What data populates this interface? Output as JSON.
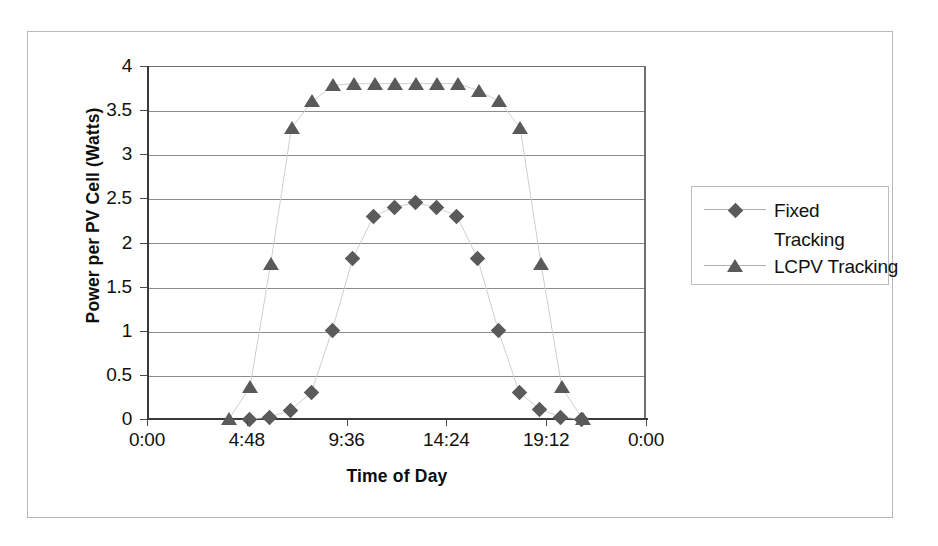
{
  "figure": {
    "frame_present": true,
    "background_color": "#ffffff",
    "marker_color": "#5a5a5a",
    "axis_color": "#3a3a3a",
    "gridline_color": "#8a8a8a"
  },
  "chart_data": {
    "type": "scatter",
    "title": "",
    "subtitle": "",
    "xlabel": "Time of Day",
    "ylabel": "Power per PV Cell (Watts)",
    "xlim": [
      0,
      24
    ],
    "ylim": [
      0,
      4
    ],
    "yticks": [
      0,
      0.5,
      1,
      1.5,
      2,
      2.5,
      3,
      3.5,
      4
    ],
    "ytick_labels": [
      "0",
      "0.5",
      "1",
      "1.5",
      "2",
      "2.5",
      "3",
      "3.5",
      "4"
    ],
    "xticks": [
      0,
      4.8,
      9.6,
      14.4,
      19.2,
      24
    ],
    "xtick_labels": [
      "0:00",
      "4:48",
      "9:36",
      "14:24",
      "19:12",
      "0:00"
    ],
    "grid": "horizontal",
    "legend_position": "right",
    "series": [
      {
        "name": "Fixed Tracking",
        "marker": "diamond",
        "color": "#5a5a5a",
        "x": [
          4.95,
          5.9,
          6.9,
          7.9,
          8.9,
          9.9,
          10.9,
          11.9,
          12.9,
          13.9,
          14.9,
          15.9,
          16.9,
          17.9,
          18.9,
          19.9,
          20.9
        ],
        "y": [
          0.0,
          0.02,
          0.1,
          0.3,
          1.0,
          1.82,
          2.3,
          2.4,
          2.45,
          2.4,
          2.3,
          1.82,
          1.0,
          0.3,
          0.11,
          0.02,
          0.0
        ]
      },
      {
        "name": "LCPV Tracking",
        "marker": "triangle",
        "color": "#5a5a5a",
        "x": [
          3.95,
          4.95,
          5.95,
          6.95,
          7.95,
          8.95,
          9.95,
          10.95,
          11.95,
          12.95,
          13.95,
          14.95,
          15.95,
          16.95,
          17.95,
          18.95,
          19.95,
          20.95
        ],
        "y": [
          0.0,
          0.36,
          1.76,
          3.3,
          3.6,
          3.78,
          3.8,
          3.8,
          3.8,
          3.8,
          3.8,
          3.8,
          3.72,
          3.6,
          3.3,
          1.76,
          0.36,
          0.0
        ]
      }
    ]
  },
  "legend": {
    "entries": [
      {
        "label_line1": "Fixed",
        "label_line2": "Tracking",
        "marker": "diamond"
      },
      {
        "label_line1": "LCPV Tracking",
        "label_line2": "",
        "marker": "triangle"
      }
    ]
  }
}
